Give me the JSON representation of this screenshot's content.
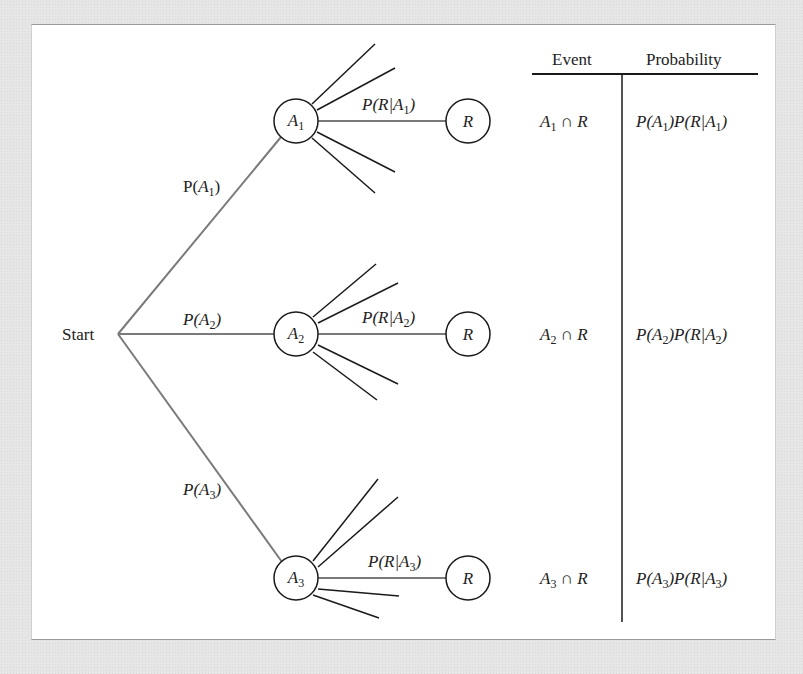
{
  "figure": {
    "start_label": "Start",
    "first_stage": [
      {
        "id": "A1",
        "branch_label": "P(",
        "branch_var": "A",
        "branch_sub": "1",
        "branch_close": ")",
        "node_var": "A",
        "node_sub": "1"
      },
      {
        "id": "A2",
        "branch_label": "P(",
        "branch_var": "A",
        "branch_sub": "2",
        "branch_close": ")",
        "node_var": "A",
        "node_sub": "2"
      },
      {
        "id": "A3",
        "branch_label": "P(",
        "branch_var": "A",
        "branch_sub": "3",
        "branch_close": ")",
        "node_var": "A",
        "node_sub": "3"
      }
    ],
    "second_stage": [
      {
        "cond_pre": "P(R|A",
        "cond_sub": "1",
        "cond_close": ")",
        "node_label": "R"
      },
      {
        "cond_pre": "P(R|A",
        "cond_sub": "2",
        "cond_close": ")",
        "node_label": "R"
      },
      {
        "cond_pre": "P(R|A",
        "cond_sub": "3",
        "cond_close": ")",
        "node_label": "R"
      }
    ]
  },
  "table": {
    "headers": {
      "event": "Event",
      "probability": "Probability"
    },
    "rows": [
      {
        "event_var": "A",
        "event_sub": "1",
        "event_rest": " ∩ R",
        "prob_a": "P(A",
        "prob_sub1": "1",
        "prob_b": ")P(R|A",
        "prob_sub2": "1",
        "prob_c": ")"
      },
      {
        "event_var": "A",
        "event_sub": "2",
        "event_rest": " ∩ R",
        "prob_a": "P(A",
        "prob_sub1": "2",
        "prob_b": ")P(R|A",
        "prob_sub2": "2",
        "prob_c": ")"
      },
      {
        "event_var": "A",
        "event_sub": "3",
        "event_rest": " ∩ R",
        "prob_a": "P(A",
        "prob_sub1": "3",
        "prob_b": ")P(R|A",
        "prob_sub2": "3",
        "prob_c": ")"
      }
    ]
  },
  "colors": {
    "branch_line": "#7a7a7a",
    "spoke_line": "#1a1a1a",
    "panel_bg": "#ffffff",
    "page_bg": "#e6e6e6"
  }
}
